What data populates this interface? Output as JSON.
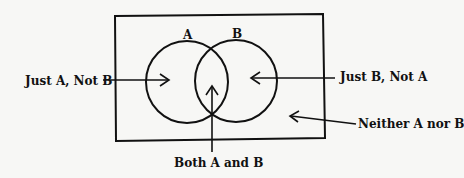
{
  "diagram": {
    "type": "venn",
    "sets": [
      {
        "id": "A",
        "label": "A"
      },
      {
        "id": "B",
        "label": "B"
      }
    ],
    "regions": {
      "just_a": "Just A, Not B",
      "just_b": "Just B, Not A",
      "both": "Both A and B",
      "neither": "Neither A nor B"
    },
    "colors": {
      "stroke": "#111111",
      "background": "#f7f7f5"
    }
  }
}
